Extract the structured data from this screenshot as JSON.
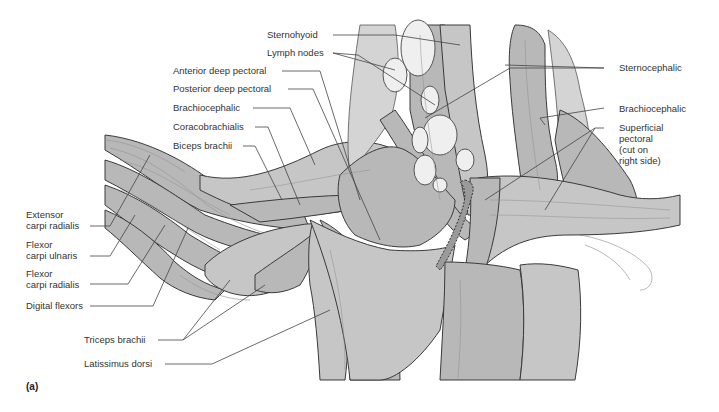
{
  "figure": {
    "panel_letter": "(a)",
    "colors": {
      "muscle_fill": "#b8b8b8",
      "muscle_outline": "#3a3a3a",
      "lymph_node_fill": "#efefef",
      "label_text": "#333333",
      "background": "#ffffff"
    }
  },
  "labels": {
    "left": [
      {
        "id": "extensor-carpi-radialis",
        "line1": "Extensor",
        "line2": "carpi radialis"
      },
      {
        "id": "flexor-carpi-ulnaris",
        "line1": "Flexor",
        "line2": "carpi ulnaris"
      },
      {
        "id": "flexor-carpi-radialis",
        "line1": "Flexor",
        "line2": "carpi radialis"
      },
      {
        "id": "digital-flexors",
        "line1": "Digital flexors"
      }
    ],
    "top_left": [
      {
        "id": "sternohyoid",
        "text": "Sternohyoid"
      },
      {
        "id": "lymph-nodes",
        "text": "Lymph nodes"
      },
      {
        "id": "anterior-deep-pectoral",
        "text": "Anterior deep pectoral"
      },
      {
        "id": "posterior-deep-pectoral",
        "text": "Posterior deep pectoral"
      },
      {
        "id": "brachiocephalic-left",
        "text": "Brachiocephalic"
      },
      {
        "id": "coracobrachialis",
        "text": "Coracobrachialis"
      },
      {
        "id": "biceps-brachii",
        "text": "Biceps brachii"
      }
    ],
    "bottom": [
      {
        "id": "triceps-brachii",
        "text": "Triceps brachii"
      },
      {
        "id": "latissimus-dorsi",
        "text": "Latissimus dorsi"
      }
    ],
    "right": [
      {
        "id": "sternocephalic",
        "text": "Sternocephalic"
      },
      {
        "id": "brachiocephalic-right",
        "text": "Brachiocephalic"
      },
      {
        "id": "superficial-pectoral",
        "line1": "Superficial",
        "line2": "pectoral",
        "line3": "(cut on",
        "line4": "right side)"
      }
    ]
  }
}
